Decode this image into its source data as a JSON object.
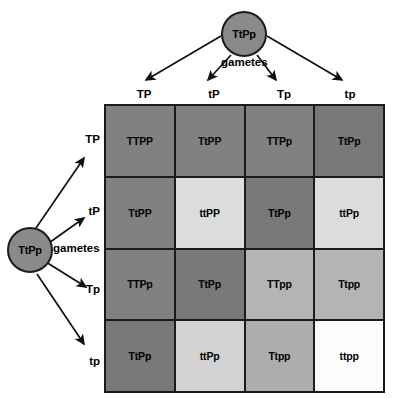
{
  "diagram": {
    "parents": {
      "top": {
        "genotype": "TtPp",
        "gametes_label": "gametes"
      },
      "left": {
        "genotype": "TtPp",
        "gametes_label": "gametes"
      }
    },
    "column_gametes": [
      "TP",
      "tP",
      "Tp",
      "tp"
    ],
    "row_gametes": [
      "TP",
      "tP",
      "Tp",
      "tp"
    ],
    "grid": [
      [
        {
          "genotype": "TTPP",
          "shade": "#818181"
        },
        {
          "genotype": "TtPP",
          "shade": "#818181"
        },
        {
          "genotype": "TTPp",
          "shade": "#818181"
        },
        {
          "genotype": "TtPp",
          "shade": "#797979"
        }
      ],
      [
        {
          "genotype": "TtPP",
          "shade": "#818181"
        },
        {
          "genotype": "ttPP",
          "shade": "#dcdcdc"
        },
        {
          "genotype": "TtPp",
          "shade": "#797979"
        },
        {
          "genotype": "ttPp",
          "shade": "#dcdcdc"
        }
      ],
      [
        {
          "genotype": "TTPp",
          "shade": "#818181"
        },
        {
          "genotype": "TtPp",
          "shade": "#797979"
        },
        {
          "genotype": "TTpp",
          "shade": "#b4b4b4"
        },
        {
          "genotype": "Ttpp",
          "shade": "#b4b4b4"
        }
      ],
      [
        {
          "genotype": "TtPp",
          "shade": "#797979"
        },
        {
          "genotype": "ttPp",
          "shade": "#d2d2d2"
        },
        {
          "genotype": "Ttpp",
          "shade": "#adadad"
        },
        {
          "genotype": "ttpp",
          "shade": "#fcfcfc"
        }
      ]
    ],
    "colors": {
      "outline": "#1b1b1b",
      "circle_fill": "#8a8a8a",
      "background": "#ffffff"
    }
  }
}
